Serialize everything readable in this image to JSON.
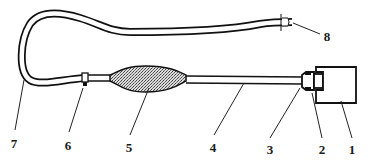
{
  "figure": {
    "type": "technical line drawing",
    "colors": {
      "ink": "#111111",
      "background": "#ffffff",
      "fill_pattern": "#888888"
    },
    "callouts": [
      {
        "id": "1",
        "label": "1",
        "part": "housing-block"
      },
      {
        "id": "2",
        "label": "2",
        "part": "inner-fitting"
      },
      {
        "id": "3",
        "label": "3",
        "part": "connector-nut"
      },
      {
        "id": "4",
        "label": "4",
        "part": "straight-tube"
      },
      {
        "id": "5",
        "label": "5",
        "part": "bulb-balloon"
      },
      {
        "id": "6",
        "label": "6",
        "part": "clamp"
      },
      {
        "id": "7",
        "label": "7",
        "part": "flexible-hose"
      },
      {
        "id": "8",
        "label": "8",
        "part": "end-connector"
      }
    ]
  }
}
